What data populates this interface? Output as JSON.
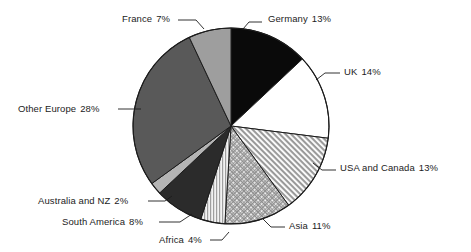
{
  "chart_data": {
    "type": "pie",
    "title": "",
    "subtitle": "",
    "xlabel": "",
    "ylabel": "",
    "legend_position": "none",
    "grid": false,
    "units": "percent",
    "start_angle_deg": 0,
    "direction": "clockwise",
    "categories": [
      "Germany",
      "UK",
      "USA and Canada",
      "Asia",
      "Africa",
      "South America",
      "Australia and NZ",
      "Other Europe",
      "France"
    ],
    "values": [
      13,
      14,
      13,
      11,
      4,
      8,
      2,
      28,
      7
    ],
    "total": 100,
    "slices": [
      {
        "label": "Germany",
        "value": 13,
        "value_text": "13%",
        "fill": "#0a0a0a",
        "pattern": "solid",
        "label_pos": {
          "x": 268,
          "y": 13
        },
        "label_align": "left",
        "leader": [
          [
            262,
            22
          ],
          [
            249,
            22
          ],
          [
            243,
            29
          ]
        ]
      },
      {
        "label": "UK",
        "value": 14,
        "value_text": "14%",
        "fill": "#ffffff",
        "pattern": "solid",
        "label_pos": {
          "x": 344,
          "y": 66
        },
        "label_align": "left",
        "leader": [
          [
            340,
            73
          ],
          [
            325,
            73
          ],
          [
            316,
            80
          ]
        ]
      },
      {
        "label": "USA and Canada",
        "value": 13,
        "value_text": "13%",
        "fill": "#cfcfcf",
        "pattern": "diagonal-hatch",
        "label_pos": {
          "x": 340,
          "y": 162
        },
        "label_align": "left",
        "leader": [
          [
            336,
            170
          ],
          [
            322,
            170
          ],
          [
            313,
            163
          ]
        ]
      },
      {
        "label": "Asia",
        "value": 11,
        "value_text": "11%",
        "fill": "#c4c4c4",
        "pattern": "crosshatch",
        "label_pos": {
          "x": 289,
          "y": 220
        },
        "label_align": "left",
        "leader": [
          [
            285,
            227
          ],
          [
            271,
            227
          ],
          [
            263,
            219
          ]
        ]
      },
      {
        "label": "Africa",
        "value": 4,
        "value_text": "4%",
        "fill": "#d8d8d8",
        "pattern": "vertical-stripe",
        "label_pos": {
          "x": 159,
          "y": 234
        },
        "label_align": "right",
        "leader": [
          [
            210,
            240
          ],
          [
            222,
            240
          ],
          [
            229,
            232
          ]
        ]
      },
      {
        "label": "South America",
        "value": 8,
        "value_text": "8%",
        "fill": "#2b2b2b",
        "pattern": "solid",
        "label_pos": {
          "x": 62,
          "y": 216
        },
        "label_align": "right",
        "leader": [
          [
            159,
            222
          ],
          [
            180,
            222
          ],
          [
            192,
            214
          ]
        ]
      },
      {
        "label": "Australia and NZ",
        "value": 2,
        "value_text": "2%",
        "fill": "#b4b4b4",
        "pattern": "solid",
        "label_pos": {
          "x": 38,
          "y": 195
        },
        "label_align": "right",
        "leader": [
          [
            148,
            201
          ],
          [
            165,
            201
          ],
          [
            172,
            196
          ]
        ]
      },
      {
        "label": "Other Europe",
        "value": 28,
        "value_text": "28%",
        "fill": "#595959",
        "pattern": "solid",
        "label_pos": {
          "x": 18,
          "y": 103
        },
        "label_align": "right",
        "leader": [
          [
            118,
            109
          ],
          [
            141,
            109
          ]
        ]
      },
      {
        "label": "France",
        "value": 7,
        "value_text": "7%",
        "fill": "#9e9e9e",
        "pattern": "solid",
        "label_pos": {
          "x": 122,
          "y": 13
        },
        "label_align": "right",
        "leader": [
          [
            178,
            20
          ],
          [
            196,
            20
          ],
          [
            204,
            29
          ]
        ]
      }
    ],
    "geometry": {
      "center_x": 231,
      "center_y": 126,
      "radius": 98,
      "outline_color": "#1c1c1c"
    }
  }
}
